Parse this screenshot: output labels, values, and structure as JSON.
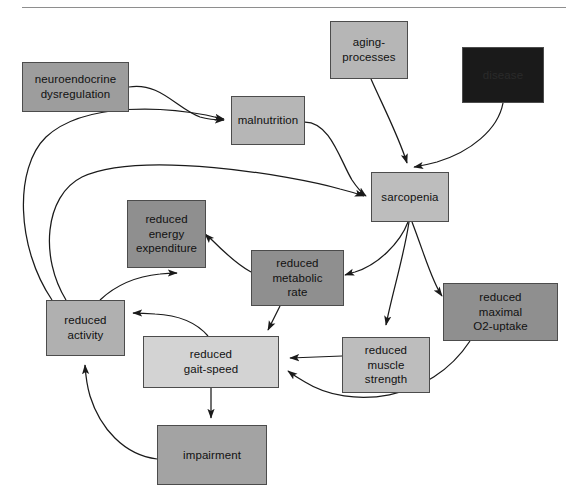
{
  "diagram": {
    "divider_present": true,
    "background_color": "#ffffff",
    "palette": {
      "light_gray": "#d3d3d3",
      "mid_gray": "#bdbdbd",
      "dark_gray": "#8f8f8f",
      "black_box": "#1a1a1a",
      "border": "#4c4c4c",
      "edge": "#1a1a1a"
    },
    "nodes": [
      {
        "id": "neuroendocrine-dysregulation",
        "label": "neuroendocrine\ndysregulation",
        "line1": "neuroendocrine",
        "line2": "dysregulation",
        "x": 22,
        "y": 62,
        "w": 107,
        "h": 50,
        "fill": "#9d9d9d",
        "text_color": "#111111"
      },
      {
        "id": "aging-processes",
        "label": "aging-\nprocesses",
        "line1": "aging-",
        "line2": "processes",
        "x": 330,
        "y": 21,
        "w": 78,
        "h": 58,
        "fill": "#b6b6b6",
        "text_color": "#111111"
      },
      {
        "id": "disease",
        "label": "disease",
        "line1": "disease",
        "line2": "",
        "x": 462,
        "y": 47,
        "w": 82,
        "h": 56,
        "fill": "#1a1a1a",
        "text_color": "#2b2b2b"
      },
      {
        "id": "malnutrition",
        "label": "malnutrition",
        "line1": "malnutrition",
        "line2": "",
        "x": 231,
        "y": 96,
        "w": 74,
        "h": 49,
        "fill": "#b6b6b6",
        "text_color": "#111111"
      },
      {
        "id": "sarcopenia",
        "label": "sarcopenia",
        "line1": "sarcopenia",
        "line2": "",
        "x": 371,
        "y": 172,
        "w": 78,
        "h": 50,
        "fill": "#bdbdbd",
        "text_color": "#111111"
      },
      {
        "id": "reduced-energy-expenditure",
        "label": "reduced\nenergy\nexpenditure",
        "line1": "reduced",
        "line2": "energy",
        "line3": "expenditure",
        "x": 127,
        "y": 200,
        "w": 79,
        "h": 68,
        "fill": "#8f8f8f",
        "text_color": "#111111"
      },
      {
        "id": "reduced-metabolic-rate",
        "label": "reduced\nmetabolic\nrate",
        "line1": "reduced",
        "line2": "metabolic",
        "line3": "rate",
        "x": 251,
        "y": 250,
        "w": 93,
        "h": 56,
        "fill": "#8f8f8f",
        "text_color": "#111111"
      },
      {
        "id": "reduced-maximal-o2-uptake",
        "label": "reduced\nmaximal\nO2-uptake",
        "line1": "reduced",
        "line2": "maximal",
        "line3": "O2-uptake",
        "x": 443,
        "y": 283,
        "w": 115,
        "h": 58,
        "fill": "#8f8f8f",
        "text_color": "#111111"
      },
      {
        "id": "reduced-activity",
        "label": "reduced\nactivity",
        "line1": "reduced",
        "line2": "activity",
        "x": 46,
        "y": 300,
        "w": 79,
        "h": 56,
        "fill": "#b0b0b0",
        "text_color": "#111111"
      },
      {
        "id": "reduced-gait-speed",
        "label": "reduced\ngait-speed",
        "line1": "reduced",
        "line2": "gait-speed",
        "x": 143,
        "y": 336,
        "w": 136,
        "h": 52,
        "fill": "#d3d3d3",
        "text_color": "#111111"
      },
      {
        "id": "reduced-muscle-strength",
        "label": "reduced\nmuscle\nstrength",
        "line1": "reduced",
        "line2": "muscle",
        "line3": "strength",
        "x": 342,
        "y": 337,
        "w": 88,
        "h": 56,
        "fill": "#bdbdbd",
        "text_color": "#111111"
      },
      {
        "id": "impairment",
        "label": "impairment",
        "line1": "impairment",
        "line2": "",
        "x": 157,
        "y": 425,
        "w": 110,
        "h": 60,
        "fill": "#a3a3a3",
        "text_color": "#111111"
      }
    ],
    "edges": [
      {
        "from": "neuroendocrine-dysregulation",
        "to": "malnutrition"
      },
      {
        "from": "malnutrition",
        "to": "sarcopenia"
      },
      {
        "from": "aging-processes",
        "to": "sarcopenia"
      },
      {
        "from": "disease",
        "to": "sarcopenia"
      },
      {
        "from": "sarcopenia",
        "to": "reduced-metabolic-rate"
      },
      {
        "from": "sarcopenia",
        "to": "reduced-muscle-strength"
      },
      {
        "from": "sarcopenia",
        "to": "reduced-maximal-o2-uptake"
      },
      {
        "from": "reduced-metabolic-rate",
        "to": "reduced-energy-expenditure"
      },
      {
        "from": "reduced-metabolic-rate",
        "to": "reduced-gait-speed"
      },
      {
        "from": "reduced-muscle-strength",
        "to": "reduced-gait-speed"
      },
      {
        "from": "reduced-maximal-o2-uptake",
        "to": "reduced-gait-speed"
      },
      {
        "from": "reduced-gait-speed",
        "to": "reduced-activity"
      },
      {
        "from": "reduced-gait-speed",
        "to": "impairment"
      },
      {
        "from": "impairment",
        "to": "reduced-activity"
      },
      {
        "from": "reduced-activity",
        "to": "reduced-energy-expenditure"
      },
      {
        "from": "reduced-activity",
        "to": "malnutrition"
      },
      {
        "from": "reduced-activity",
        "to": "sarcopenia"
      }
    ]
  }
}
